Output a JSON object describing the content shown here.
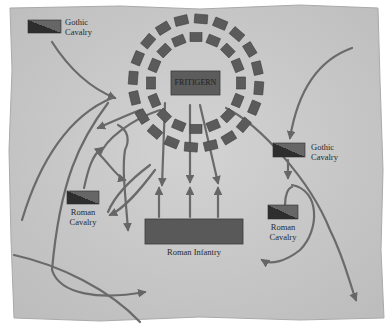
{
  "diagram": {
    "colors": {
      "parchment": "#c9c9c9",
      "parchment_edge": "#b4b4b4",
      "unit_fill": "#5a5a5a",
      "unit_dark": "#2e2e2e",
      "arrow": "#6a6a6a",
      "text": "#2a2a2a"
    },
    "units": [
      {
        "id": "gothic-cavalry-nw",
        "label_line1": "Gothic",
        "label_line2": "Cavalry",
        "side": "goth"
      },
      {
        "id": "fritigern",
        "label": "FRITIGERN",
        "side": "goth"
      },
      {
        "id": "gothic-cavalry-e",
        "label_line1": "Gothic",
        "label_line2": "Cavalry",
        "side": "goth"
      },
      {
        "id": "roman-cavalry-w",
        "label_line1": "Roman",
        "label_line2": "Cavalry",
        "side": "roman"
      },
      {
        "id": "roman-infantry",
        "label": "Roman Infantry",
        "side": "roman"
      },
      {
        "id": "roman-cavalry-e",
        "label_line1": "Roman",
        "label_line2": "Cavalry",
        "side": "roman"
      }
    ],
    "wagon_laager": {
      "outer_ring_wagons": 20,
      "inner_ring_wagons": 16
    }
  }
}
